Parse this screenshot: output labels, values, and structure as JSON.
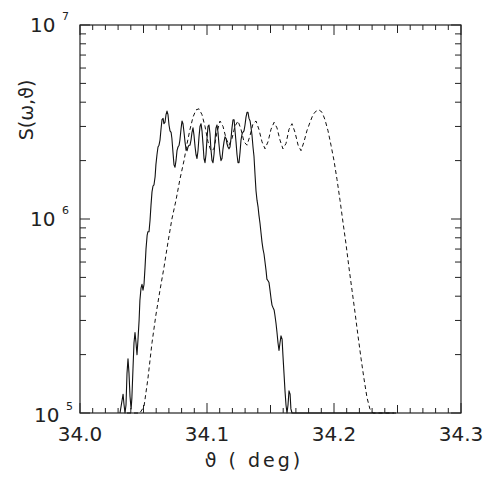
{
  "chart_data": {
    "type": "line",
    "title": "",
    "xlabel": "ϑ ( deg)",
    "ylabel": "S(ω,ϑ)",
    "xlim": [
      34.0,
      34.3
    ],
    "ylim": [
      100000,
      10000000
    ],
    "yscale": "log",
    "grid": false,
    "legend": null,
    "x_ticks": [
      "34.0",
      "34.1",
      "34.2",
      "34.3"
    ],
    "x_tick_values": [
      34.0,
      34.1,
      34.2,
      34.3
    ],
    "y_ticks": [
      {
        "base": "10",
        "exp": "7",
        "value": 10000000
      },
      {
        "base": "10",
        "exp": "6",
        "value": 1000000
      },
      {
        "base": "10",
        "exp": "5",
        "value": 100000
      }
    ],
    "series": [
      {
        "name": "solid",
        "style": "solid",
        "x": [
          34.0315,
          34.0339,
          34.0346,
          34.0354,
          34.0362,
          34.037,
          34.0378,
          34.0386,
          34.0394,
          34.0402,
          34.0409,
          34.0417,
          34.0425,
          34.0433,
          34.0441,
          34.0449,
          34.0457,
          34.0465,
          34.0472,
          34.048,
          34.0488,
          34.0496,
          34.0504,
          34.0512,
          34.052,
          34.0528,
          34.0535,
          34.0543,
          34.0551,
          34.0559,
          34.0567,
          34.0575,
          34.0583,
          34.0591,
          34.0598,
          34.0606,
          34.0614,
          34.0622,
          34.063,
          34.0638,
          34.0646,
          34.0654,
          34.0661,
          34.0669,
          34.0677,
          34.0685,
          34.0693,
          34.0701,
          34.0709,
          34.0717,
          34.0724,
          34.0732,
          34.074,
          34.0748,
          34.0756,
          34.0764,
          34.0772,
          34.078,
          34.0787,
          34.0795,
          34.0803,
          34.0811,
          34.0819,
          34.0827,
          34.0835,
          34.0843,
          34.085,
          34.0858,
          34.0866,
          34.0874,
          34.0882,
          34.089,
          34.0898,
          34.0906,
          34.0913,
          34.0921,
          34.0929,
          34.0937,
          34.0945,
          34.0953,
          34.0961,
          34.0969,
          34.0976,
          34.0984,
          34.0992,
          34.1,
          34.1008,
          34.1016,
          34.1024,
          34.1031,
          34.1039,
          34.1047,
          34.1055,
          34.1063,
          34.1071,
          34.1079,
          34.1087,
          34.1094,
          34.1102,
          34.111,
          34.1118,
          34.1126,
          34.1134,
          34.1142,
          34.115,
          34.1157,
          34.1165,
          34.1173,
          34.1181,
          34.1189,
          34.1197,
          34.1205,
          34.1213,
          34.122,
          34.1228,
          34.1236,
          34.1244,
          34.1252,
          34.126,
          34.1268,
          34.1276,
          34.1283,
          34.1291,
          34.1299,
          34.1307,
          34.1315,
          34.1323,
          34.1331,
          34.1339,
          34.1346,
          34.1354,
          34.1362,
          34.137,
          34.1378,
          34.1386,
          34.1394,
          34.1402,
          34.1409,
          34.1417,
          34.1425,
          34.1433,
          34.1441,
          34.1449,
          34.1457,
          34.1465,
          34.1472,
          34.148,
          34.1488,
          34.1496,
          34.1504,
          34.1512,
          34.152,
          34.1528,
          34.1535,
          34.1543,
          34.1551,
          34.1559,
          34.1567,
          34.1575,
          34.1583,
          34.1591,
          34.1598,
          34.1606,
          34.1614,
          34.1622,
          34.163,
          34.1638,
          34.1646,
          34.1654,
          34.1661,
          34.1669,
          34.1677,
          34.1685,
          34.1693,
          34.1701,
          34.1709,
          34.1717,
          34.1724,
          34.1732,
          34.174,
          34.1748,
          34.1756,
          34.1764,
          34.1772,
          34.178,
          34.1787,
          34.1795,
          34.1803,
          34.1811,
          34.1819,
          34.1827,
          34.1835,
          34.1843,
          34.185,
          34.1858,
          34.1866,
          34.1874,
          34.1882,
          34.189,
          34.1898,
          34.1906,
          34.1913,
          34.1921,
          34.1929,
          34.1937,
          34.1945,
          34.1953,
          34.1961,
          34.1969,
          34.1976,
          34.1984,
          34.1992,
          34.2,
          34.2008,
          34.2016,
          34.2024,
          34.2031,
          34.2039,
          34.2047,
          34.2055,
          34.2063,
          34.2071,
          34.2079,
          34.2087,
          34.2094,
          34.2102,
          34.211,
          34.2118,
          34.2126,
          34.2134,
          34.2142,
          34.215,
          34.2157,
          34.2165,
          34.2173,
          34.2181,
          34.2189,
          34.2197,
          34.2205,
          34.2213,
          34.222,
          34.2228,
          34.2236,
          34.2244,
          34.2252,
          34.226,
          34.2268,
          34.2276,
          34.2283,
          34.2291,
          34.2299,
          34.2307,
          34.2315,
          34.2323,
          34.2331,
          34.2339,
          34.2346,
          34.2354,
          34.2362,
          34.237,
          34.2378,
          34.2386,
          34.2394,
          34.2402,
          34.2409,
          34.2417,
          34.2425,
          34.2433,
          34.2441,
          34.2449,
          34.2457,
          34.2465,
          34.2472,
          34.248,
          34.2488
        ],
        "y": [
          100000,
          125000,
          112000,
          100000,
          110000,
          160000,
          190000,
          160000,
          122000,
          105000,
          120000,
          170000,
          230000,
          260000,
          230000,
          200000,
          240000,
          300000,
          380000,
          440000,
          460000,
          430000,
          460000,
          560000,
          700000,
          820000,
          860000,
          860000,
          980000,
          1180000,
          1380000,
          1480000,
          1500000,
          1650000,
          1900000,
          2150000,
          2350000,
          2400000,
          2550000,
          2900000,
          3250000,
          3300000,
          3100000,
          3150000,
          3450000,
          3600000,
          3450000,
          3050000,
          2850000,
          2800000,
          2600000,
          2200000,
          1900000,
          1850000,
          2000000,
          2250000,
          2350000,
          2400000,
          2550000,
          2900000,
          3200000,
          3100000,
          2800000,
          2500000,
          2300000,
          2250000,
          2350000,
          2400000,
          2400000,
          2550000,
          2800000,
          2950000,
          2700000,
          2350000,
          2150000,
          2050000,
          2250000,
          2650000,
          3000000,
          3100000,
          2850000,
          2400000,
          2050000,
          1950000,
          2150000,
          2600000,
          3000000,
          3050000,
          2750000,
          2300000,
          2000000,
          1950000,
          2150000,
          2550000,
          2950000,
          3050000,
          2800000,
          2450000,
          2150000,
          2000000,
          2050000,
          2300000,
          2500000,
          2650000,
          2600000,
          2450000,
          2350000,
          2300000,
          2350000,
          2600000,
          2950000,
          3250000,
          3250000,
          2900000,
          2500000,
          2150000,
          1950000,
          1950000,
          2200000,
          2550000,
          2750000,
          2800000,
          2850000,
          3050000,
          3350000,
          3550000,
          3550000,
          3300000,
          3200000,
          3000000,
          2700000,
          2350000,
          2100000,
          1700000,
          1400000,
          1250000,
          1150000,
          1050000,
          950000,
          850000,
          760000,
          700000,
          660000,
          600000,
          540000,
          490000,
          480000,
          470000,
          430000,
          390000,
          360000,
          350000,
          340000,
          320000,
          290000,
          260000,
          230000,
          210000,
          230000,
          250000,
          240000,
          200000,
          160000,
          130000,
          110000,
          100000,
          110000,
          130000,
          125000,
          105000,
          100000,
          100000,
          100000,
          100000,
          100000,
          100000,
          100000,
          100000,
          100000,
          100000,
          100000,
          100000,
          100000,
          100000,
          100000,
          100000,
          100000,
          100000,
          100000,
          100000,
          100000,
          100000,
          100000,
          100000,
          100000,
          100000,
          100000,
          100000,
          100000,
          100000,
          100000,
          100000,
          100000,
          100000,
          100000,
          100000,
          100000,
          100000,
          100000,
          100000,
          100000,
          100000,
          100000,
          100000,
          100000,
          100000,
          100000,
          100000,
          100000,
          100000,
          100000,
          100000,
          100000,
          100000,
          100000,
          100000,
          100000,
          100000,
          100000,
          100000,
          100000,
          100000,
          100000,
          100000,
          100000,
          100000,
          100000,
          100000,
          100000,
          100000,
          100000,
          100000,
          100000,
          100000,
          100000,
          100000,
          100000,
          100000,
          100000,
          100000,
          100000,
          100000,
          100000,
          100000,
          100000,
          100000,
          100000,
          100000,
          100000,
          100000,
          100000,
          100000,
          100000,
          100000,
          100000,
          100000,
          100000,
          100000,
          100000,
          100000,
          100000,
          100000,
          100000,
          100000,
          100000
        ]
      },
      {
        "name": "dashed",
        "style": "dashed",
        "x": [
          34.037,
          34.0417,
          34.0441,
          34.0472,
          34.0504,
          34.0535,
          34.0567,
          34.0598,
          34.063,
          34.0661,
          34.0693,
          34.0724,
          34.0756,
          34.0787,
          34.0819,
          34.0843,
          34.0866,
          34.089,
          34.0913,
          34.0937,
          34.0961,
          34.0984,
          34.1008,
          34.1031,
          34.1055,
          34.1079,
          34.1102,
          34.1126,
          34.115,
          34.1173,
          34.1197,
          34.122,
          34.1244,
          34.1268,
          34.1291,
          34.1315,
          34.1339,
          34.1362,
          34.1386,
          34.1409,
          34.1433,
          34.1457,
          34.148,
          34.1504,
          34.1528,
          34.1551,
          34.1575,
          34.1598,
          34.1622,
          34.1646,
          34.1669,
          34.1693,
          34.1717,
          34.174,
          34.1764,
          34.1787,
          34.1811,
          34.1835,
          34.1858,
          34.1882,
          34.1906,
          34.1929,
          34.1953,
          34.1976,
          34.2,
          34.2024,
          34.2047,
          34.2071,
          34.2094,
          34.2118,
          34.2142,
          34.2165,
          34.2189,
          34.2213,
          34.2236,
          34.226,
          34.2283,
          34.2307,
          34.2331,
          34.2354,
          34.2378,
          34.2402,
          34.2425,
          34.2441,
          34.2457,
          34.2472
        ],
        "y": [
          100000,
          100000,
          100000,
          100000,
          108000,
          150000,
          230000,
          320000,
          430000,
          560000,
          760000,
          1000000,
          1250000,
          1600000,
          2000000,
          2450000,
          2900000,
          3350000,
          3650000,
          3700000,
          3450000,
          3000000,
          2500000,
          2250000,
          2300000,
          2800000,
          3200000,
          3000000,
          2600000,
          2400000,
          2600000,
          3000000,
          3200000,
          2900000,
          2500000,
          2400000,
          2700000,
          3100000,
          3200000,
          2900000,
          2500000,
          2300000,
          2500000,
          2900000,
          3150000,
          2950000,
          2550000,
          2300000,
          2450000,
          2900000,
          3100000,
          2800000,
          2400000,
          2250000,
          2500000,
          2850000,
          3150000,
          3450000,
          3600000,
          3650000,
          3550000,
          3250000,
          2850000,
          2400000,
          2000000,
          1600000,
          1250000,
          960000,
          750000,
          560000,
          430000,
          330000,
          250000,
          190000,
          150000,
          120000,
          105000,
          100000,
          100000,
          100000,
          100000,
          100000,
          100000,
          100000,
          100000,
          100000
        ]
      }
    ]
  },
  "axes": {
    "xlabel_text": "ϑ ( deg)",
    "ylabel_text": "S(ω,ϑ)",
    "x_tick_labels": [
      "34.0",
      "34.1",
      "34.2",
      "34.3"
    ],
    "y_tick_bases": [
      "10",
      "10",
      "10"
    ],
    "y_tick_exps": [
      "7",
      "6",
      "5"
    ]
  }
}
